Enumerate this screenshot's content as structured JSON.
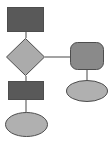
{
  "diagram": {
    "type": "flowchart",
    "title": "",
    "canvas": {
      "width": 111,
      "height": 145,
      "background": "#ffffff"
    },
    "palette": {
      "process_fill": "#595959",
      "decision_fill": "#ababab",
      "terminator_fill": "#b0b0b0",
      "rounded_fill": "#8a8a8a",
      "stroke": "#4d4d4d",
      "connector": "#8c8c8c"
    },
    "nodes": [
      {
        "id": "node-top-process",
        "name": "process-top",
        "shape": "rectangle",
        "label": "",
        "fill": "#595959",
        "stroke": "#4d4d4d",
        "x": 7,
        "y": 7,
        "width": 37,
        "height": 25
      },
      {
        "id": "node-decision",
        "name": "decision",
        "shape": "diamond",
        "label": "",
        "fill": "#ababab",
        "stroke": "#4d4d4d",
        "x": 6,
        "y": 38,
        "width": 39,
        "height": 38
      },
      {
        "id": "node-bottom-process",
        "name": "process-bottom",
        "shape": "rectangle",
        "label": "",
        "fill": "#595959",
        "stroke": "#4d4d4d",
        "x": 8,
        "y": 81,
        "width": 36,
        "height": 19
      },
      {
        "id": "node-bottom-terminator",
        "name": "terminator-bottom",
        "shape": "ellipse",
        "label": "",
        "fill": "#b0b0b0",
        "stroke": "#4d4d4d",
        "x": 5,
        "y": 112,
        "width": 43,
        "height": 25
      },
      {
        "id": "node-right-rounded",
        "name": "rounded-process-right",
        "shape": "rounded-rectangle",
        "label": "",
        "fill": "#8a8a8a",
        "stroke": "#4d4d4d",
        "x": 70,
        "y": 42,
        "width": 34,
        "height": 28,
        "corner_radius": 7
      },
      {
        "id": "node-right-terminator",
        "name": "terminator-right",
        "shape": "ellipse",
        "label": "",
        "fill": "#b0b0b0",
        "stroke": "#4d4d4d",
        "x": 66,
        "y": 80,
        "width": 42,
        "height": 22
      }
    ],
    "edges": [
      {
        "id": "edge-top-to-decision",
        "name": "connector-process-top-to-decision",
        "from": "node-top-process",
        "to": "node-decision",
        "label": "",
        "points": "26,32 26,38"
      },
      {
        "id": "edge-decision-to-right",
        "name": "connector-decision-to-rounded-right",
        "from": "node-decision",
        "to": "node-right-rounded",
        "label": "",
        "points": "45,57 70,57"
      },
      {
        "id": "edge-decision-to-bottom",
        "name": "connector-decision-to-process-bottom",
        "from": "node-decision",
        "to": "node-bottom-process",
        "label": "",
        "points": "26,76 26,81"
      },
      {
        "id": "edge-bottom-to-terminator",
        "name": "connector-process-bottom-to-terminator",
        "from": "node-bottom-process",
        "to": "node-bottom-terminator",
        "label": "",
        "points": "26,100 26,114"
      },
      {
        "id": "edge-right-to-terminator",
        "name": "connector-rounded-right-to-terminator",
        "from": "node-right-rounded",
        "to": "node-right-terminator",
        "label": "",
        "points": "87,70 87,82"
      }
    ]
  }
}
